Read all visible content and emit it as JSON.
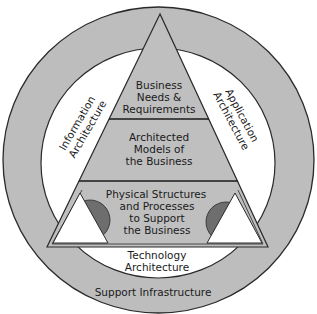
{
  "diagram": {
    "outer_ring_label": "Support Infrastructure",
    "left_label": {
      "line1": "Information",
      "line2": "Architecture"
    },
    "right_label": {
      "line1": "Application",
      "line2": "Architecture"
    },
    "bottom_label": {
      "line1": "Technology",
      "line2": "Architecture"
    },
    "pyramid": {
      "top": {
        "line1": "Business",
        "line2": "Needs &",
        "line3": "Requirements"
      },
      "middle": {
        "line1": "Architected",
        "line2": "Models of",
        "line3": "the Business"
      },
      "bottom": {
        "line1": "Physical Structures",
        "line2": "and Processes",
        "line3": "to Support",
        "line4": "the Business"
      }
    },
    "colors": {
      "ring_fill": "#bdbdbd",
      "pyramid_fill": "#bfbfbf",
      "inner_fill": "#ffffff",
      "half_disc_fill": "#6e6e6e",
      "stroke": "#2a2a2a"
    }
  }
}
